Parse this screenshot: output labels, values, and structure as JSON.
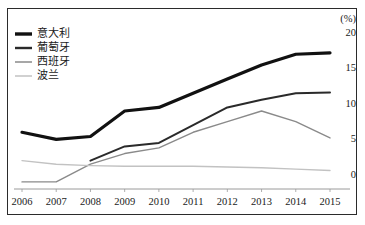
{
  "chart_data": {
    "type": "line",
    "title": "",
    "xlabel": "",
    "ylabel": "",
    "unit_label": "(%)",
    "grid": false,
    "legend_position": "top-left",
    "x": [
      2006,
      2007,
      2008,
      2009,
      2010,
      2011,
      2012,
      2013,
      2014,
      2015
    ],
    "categories": [
      "2006",
      "2007",
      "2008",
      "2009",
      "2010",
      "2011",
      "2012",
      "2013",
      "2014",
      "2015"
    ],
    "xlim": [
      2006,
      2015
    ],
    "ylim": [
      -2,
      20
    ],
    "yticks": [
      0,
      5,
      10,
      15,
      20
    ],
    "ytick_labels": [
      "0",
      "5",
      "10",
      "15",
      "20"
    ],
    "series": [
      {
        "name": "意大利",
        "color": "#111111",
        "width": 3.2,
        "values": [
          6.0,
          5.0,
          5.4,
          9.0,
          9.5,
          11.5,
          13.5,
          15.5,
          17.0,
          17.2
        ]
      },
      {
        "name": "葡萄牙",
        "color": "#2a2a2a",
        "width": 2.0,
        "values": [
          null,
          null,
          2.0,
          4.0,
          4.5,
          7.0,
          9.5,
          10.6,
          11.5,
          11.6
        ]
      },
      {
        "name": "西班牙",
        "color": "#8a8a8a",
        "width": 1.4,
        "values": [
          -1.0,
          -1.0,
          1.5,
          3.0,
          3.8,
          6.0,
          7.5,
          9.0,
          7.5,
          5.2
        ]
      },
      {
        "name": "波兰",
        "color": "#c2c2c2",
        "width": 1.4,
        "values": [
          2.0,
          1.5,
          1.3,
          1.2,
          1.2,
          1.2,
          1.1,
          1.0,
          0.8,
          0.6
        ]
      }
    ]
  },
  "legend": {
    "items": [
      {
        "label": "意大利"
      },
      {
        "label": "葡萄牙"
      },
      {
        "label": "西班牙"
      },
      {
        "label": "波兰"
      }
    ]
  },
  "axes": {
    "unit": "(%)",
    "y_labels": [
      "20",
      "15",
      "10",
      "5",
      "0"
    ],
    "x_labels": [
      "2006",
      "2007",
      "2008",
      "2009",
      "2010",
      "2011",
      "2012",
      "2013",
      "2014",
      "2015"
    ]
  }
}
